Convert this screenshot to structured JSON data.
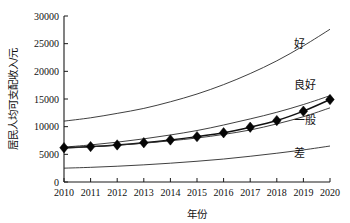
{
  "chart_data": {
    "type": "line",
    "title": "",
    "xlabel": "年份",
    "ylabel": "居民人均可支配收入/元",
    "xlim": [
      2010,
      2020
    ],
    "ylim": [
      0,
      30000
    ],
    "grid": false,
    "legend_position": "inline-right",
    "x": [
      2010,
      2011,
      2012,
      2013,
      2014,
      2015,
      2016,
      2017,
      2018,
      2019,
      2020
    ],
    "xticklabels": [
      "2010",
      "2011",
      "2012",
      "2013",
      "2014",
      "2015",
      "2016",
      "2017",
      "2018",
      "2019",
      "2020"
    ],
    "yticks": [
      0,
      5000,
      10000,
      15000,
      20000,
      25000,
      30000
    ],
    "yticklabels": [
      "0",
      "5000",
      "10000",
      "15000",
      "20000",
      "25000",
      "30000"
    ],
    "series": [
      {
        "name": "好",
        "label": "好",
        "marker": "none",
        "values": [
          11000,
          11600,
          12400,
          13300,
          14500,
          15900,
          17600,
          19600,
          21900,
          24600,
          27600
        ]
      },
      {
        "name": "良好",
        "label": "良好",
        "marker": "none",
        "values": [
          6300,
          6700,
          7200,
          7800,
          8500,
          9300,
          10300,
          11400,
          12600,
          14000,
          15600
        ]
      },
      {
        "name": "实测值",
        "label": "",
        "marker": "diamond",
        "values": [
          6200,
          6400,
          6700,
          7100,
          7600,
          8200,
          8900,
          9900,
          11100,
          12800,
          14900
        ]
      },
      {
        "name": "一般",
        "label": "一般",
        "marker": "none",
        "values": [
          6100,
          6350,
          6650,
          7000,
          7450,
          7950,
          8600,
          9400,
          10500,
          11800,
          13400
        ]
      },
      {
        "name": "差",
        "label": "差",
        "marker": "none",
        "values": [
          2500,
          2650,
          2850,
          3100,
          3400,
          3750,
          4150,
          4650,
          5200,
          5800,
          6500
        ]
      }
    ],
    "annotations": [
      {
        "text": "好",
        "x": 2020,
        "y": 24200
      },
      {
        "text": "良好",
        "x": 2020,
        "y": 16800
      },
      {
        "text": "一般",
        "x": 2020,
        "y": 10500
      },
      {
        "text": "差",
        "x": 2020,
        "y": 4600
      }
    ]
  }
}
